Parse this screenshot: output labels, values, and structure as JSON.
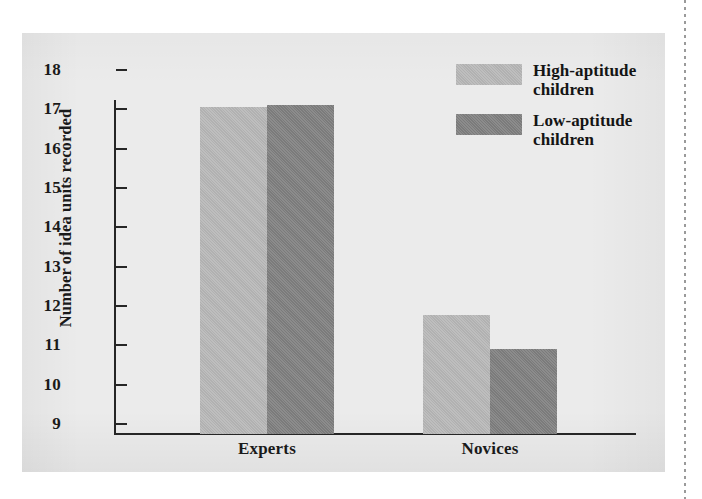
{
  "figure": {
    "panel_bg": "#ebebeb",
    "axis_color": "#262626"
  },
  "chart_data": {
    "type": "bar",
    "title": "",
    "xlabel": "",
    "ylabel": "Number of idea units recorded",
    "categories": [
      "Experts",
      "Novices"
    ],
    "ylim": [
      8.5,
      18
    ],
    "yticks": [
      18,
      17,
      16,
      15,
      14,
      13,
      12,
      11,
      10,
      9
    ],
    "ytick_labels": [
      "18",
      "17",
      "16",
      "15",
      "14",
      "13",
      "12",
      "11",
      "10",
      "9"
    ],
    "grid": false,
    "legend_position": "top-right",
    "series": [
      {
        "name": "High-aptitude children",
        "color": "#b7b7b7",
        "values": [
          17.05,
          11.78
        ]
      },
      {
        "name": "Low-aptitude children",
        "color": "#7f7f7f",
        "values": [
          17.1,
          10.9
        ]
      }
    ]
  },
  "legend": {
    "items": [
      {
        "label_line1": "High-aptitude",
        "label_line2": "children",
        "color": "#b7b7b7"
      },
      {
        "label_line1": "Low-aptitude",
        "label_line2": "children",
        "color": "#7f7f7f"
      }
    ]
  }
}
